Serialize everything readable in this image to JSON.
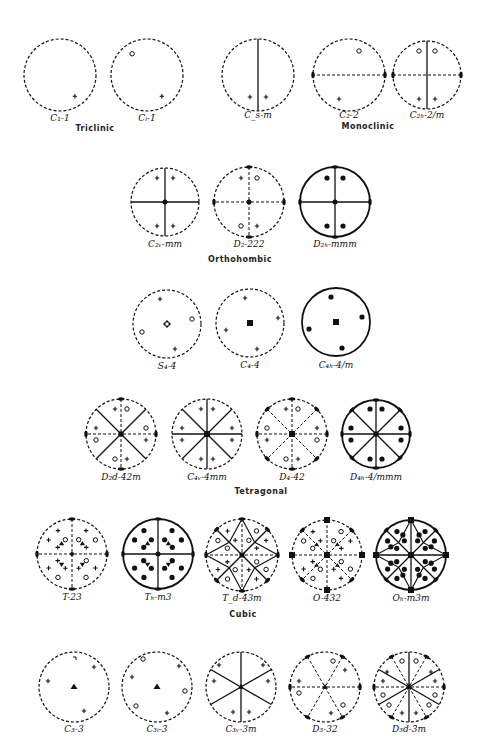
{
  "colors": {
    "ink": "#111111",
    "paper": "#ffffff"
  },
  "legend": {
    "plus": "pole above the plane",
    "open-circle": "pole below the plane",
    "filled-circle": "coincident poles above and below",
    "dashed-circle": "no horizontal mirror",
    "solid-circle": "horizontal mirror plane"
  },
  "systems": [
    {
      "name": "Triclinic",
      "x": 95,
      "y": 130
    },
    {
      "name": "Monoclinic",
      "x": 368,
      "y": 128
    },
    {
      "name": "Orthohombic",
      "x": 240,
      "y": 261
    },
    {
      "name": "Tetragonal",
      "x": 261,
      "y": 493
    },
    {
      "name": "Cubic",
      "x": 243,
      "y": 616
    }
  ],
  "groups": [
    {
      "id": "C1",
      "label": "C₁-1",
      "cx": 60,
      "cy": 75,
      "r": 36,
      "system": "Triclinic"
    },
    {
      "id": "Ci",
      "label": "Cᵢ-1̄",
      "cx": 147,
      "cy": 75,
      "r": 36,
      "system": "Triclinic"
    },
    {
      "id": "Cs",
      "label": "C_s-m",
      "cx": 258,
      "cy": 75,
      "r": 36,
      "system": "Monoclinic"
    },
    {
      "id": "C2",
      "label": "C₂-2",
      "cx": 349,
      "cy": 75,
      "r": 36,
      "system": "Monoclinic"
    },
    {
      "id": "C2h",
      "label": "C₂ₕ-2/m",
      "cx": 427,
      "cy": 75,
      "r": 34,
      "system": "Monoclinic"
    },
    {
      "id": "C2v",
      "label": "C₂ᵥ-mm",
      "cx": 165,
      "cy": 202,
      "r": 34,
      "system": "Orthohombic"
    },
    {
      "id": "D2",
      "label": "D₂-222",
      "cx": 249,
      "cy": 202,
      "r": 35,
      "system": "Orthohombic"
    },
    {
      "id": "D2h",
      "label": "D₂ₕ-mmm",
      "cx": 335,
      "cy": 202,
      "r": 35,
      "system": "Orthohombic"
    },
    {
      "id": "S4",
      "label": "S₄-4̄",
      "cx": 167,
      "cy": 324,
      "r": 34,
      "system": "Tetragonal"
    },
    {
      "id": "C4",
      "label": "C₄-4",
      "cx": 250,
      "cy": 323,
      "r": 34,
      "system": "Tetragonal"
    },
    {
      "id": "C4h",
      "label": "C₄ₕ-4/m",
      "cx": 336,
      "cy": 322,
      "r": 34,
      "system": "Tetragonal"
    },
    {
      "id": "D2d",
      "label": "D₂d-4̄2m",
      "cx": 121,
      "cy": 434,
      "r": 35,
      "system": "Tetragonal"
    },
    {
      "id": "C4v",
      "label": "C₄ᵥ-4mm",
      "cx": 207,
      "cy": 434,
      "r": 35,
      "system": "Tetragonal"
    },
    {
      "id": "D4",
      "label": "D₄-42",
      "cx": 292,
      "cy": 434,
      "r": 35,
      "system": "Tetragonal"
    },
    {
      "id": "D4h",
      "label": "D₄ₕ-4/mmm",
      "cx": 376,
      "cy": 434,
      "r": 34,
      "system": "Tetragonal"
    },
    {
      "id": "T",
      "label": "T-23",
      "cx": 72,
      "cy": 554,
      "r": 35,
      "system": "Cubic"
    },
    {
      "id": "Th",
      "label": "Tₕ-m3",
      "cx": 158,
      "cy": 554,
      "r": 35,
      "system": "Cubic"
    },
    {
      "id": "Td",
      "label": "T_d-4̄3m",
      "cx": 242,
      "cy": 555,
      "r": 36,
      "system": "Cubic"
    },
    {
      "id": "O",
      "label": "O-432",
      "cx": 327,
      "cy": 555,
      "r": 35,
      "system": "Cubic"
    },
    {
      "id": "Oh",
      "label": "Oₕ-m3m",
      "cx": 411,
      "cy": 555,
      "r": 35,
      "system": "Cubic"
    },
    {
      "id": "C3",
      "label": "C₃-3",
      "cx": 74,
      "cy": 687,
      "r": 35,
      "system": "Trigonal"
    },
    {
      "id": "C3i",
      "label": "C₃ᵢ-3̄",
      "cx": 157,
      "cy": 687,
      "r": 35,
      "system": "Trigonal"
    },
    {
      "id": "C3v",
      "label": "C₃ᵥ-3m",
      "cx": 241,
      "cy": 687,
      "r": 35,
      "system": "Trigonal"
    },
    {
      "id": "D3",
      "label": "D₃-32",
      "cx": 325,
      "cy": 687,
      "r": 35,
      "system": "Trigonal"
    },
    {
      "id": "D3d",
      "label": "D₃d-3̄m",
      "cx": 409,
      "cy": 687,
      "r": 35,
      "system": "Trigonal"
    }
  ]
}
